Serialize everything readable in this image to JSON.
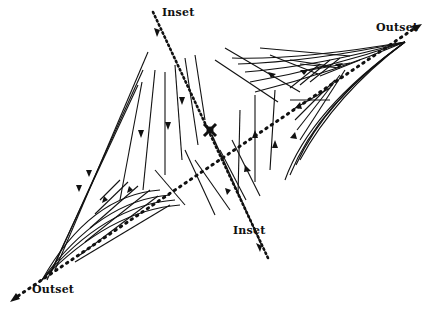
{
  "diagram": {
    "type": "phase-portrait-saddle",
    "labels": {
      "inset_top": "Inset",
      "inset_bottom": "Inset",
      "outset_right": "Outset",
      "outset_left": "Outset"
    },
    "colors": {
      "ink": "#111111",
      "background": "#ffffff"
    },
    "saddle_point": {
      "x": 210,
      "y": 130
    },
    "inset_axis": {
      "from": {
        "x": 152,
        "y": 10
      },
      "to": {
        "x": 268,
        "y": 262
      }
    },
    "outset_axis": {
      "from": {
        "x": 10,
        "y": 300
      },
      "to": {
        "x": 420,
        "y": 26
      }
    }
  }
}
